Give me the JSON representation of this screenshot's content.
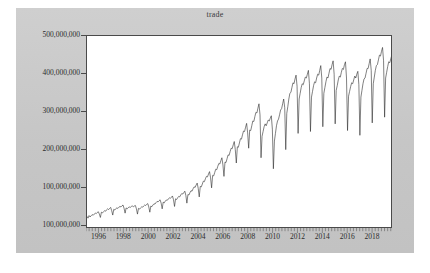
{
  "chart_data": {
    "type": "line",
    "title": "trade",
    "xlabel": "",
    "ylabel": "",
    "grid": false,
    "legend": "none",
    "line_color": "#2b2b2b",
    "background_color": "#c9c9c9",
    "plot_background_color": "#ffffff",
    "axis_color": "#4a4a4a",
    "xlim": [
      1995.0,
      2019.6
    ],
    "ylim": [
      100000000,
      500000000
    ],
    "y_ticks": [
      500000000,
      400000000,
      300000000,
      200000000,
      100000000,
      100000000
    ],
    "y_tick_labels": [
      "500,000,000",
      "400,000,000",
      "300,000,000",
      "200,000,000",
      "100,000,000",
      "100,000,000"
    ],
    "x_ticks": [
      1996,
      1998,
      2000,
      2002,
      2004,
      2006,
      2008,
      2010,
      2012,
      2014,
      2016,
      2018
    ],
    "x_tick_labels": [
      "1996",
      "1998",
      "2000",
      "2002",
      "2004",
      "2006",
      "2008",
      "2010",
      "2012",
      "2014",
      "2016",
      "2018"
    ],
    "x_minor_tick_interval_years": 0.25,
    "series": [
      {
        "name": "trade",
        "frequency": "monthly",
        "x_start": 1995.0,
        "x_step": 0.08333,
        "values": [
          122000000,
          118500000,
          124000000,
          121000000,
          123500000,
          126000000,
          124500000,
          127000000,
          129000000,
          128000000,
          130500000,
          132000000,
          127000000,
          120000000,
          131000000,
          129500000,
          132000000,
          134000000,
          133000000,
          136000000,
          138000000,
          136500000,
          139000000,
          141000000,
          134000000,
          125000000,
          137000000,
          135500000,
          138500000,
          140000000,
          139000000,
          141500000,
          143000000,
          142000000,
          144500000,
          146000000,
          139000000,
          129000000,
          140000000,
          138000000,
          140500000,
          142000000,
          141000000,
          143000000,
          144000000,
          142500000,
          144000000,
          145000000,
          138000000,
          127000000,
          139000000,
          137500000,
          140000000,
          142000000,
          141500000,
          144000000,
          146000000,
          145000000,
          147500000,
          149000000,
          142000000,
          131000000,
          144000000,
          142500000,
          146000000,
          148500000,
          148000000,
          151000000,
          153500000,
          152500000,
          155000000,
          157000000,
          150000000,
          138000000,
          152000000,
          150500000,
          154000000,
          156500000,
          156000000,
          159000000,
          161000000,
          160000000,
          162500000,
          165000000,
          157000000,
          143000000,
          159000000,
          157500000,
          161000000,
          164000000,
          163000000,
          167000000,
          170000000,
          169000000,
          172000000,
          175000000,
          166000000,
          150000000,
          168000000,
          167000000,
          172000000,
          176000000,
          175000000,
          180000000,
          184000000,
          183000000,
          188000000,
          192000000,
          181000000,
          163000000,
          185000000,
          184000000,
          190000000,
          196000000,
          195000000,
          201000000,
          206000000,
          205000000,
          211000000,
          216000000,
          203000000,
          182000000,
          208000000,
          207000000,
          214000000,
          221000000,
          220000000,
          227000000,
          233000000,
          232000000,
          239000000,
          245000000,
          230000000,
          206000000,
          236000000,
          235000000,
          243000000,
          251000000,
          250000000,
          258000000,
          265000000,
          264000000,
          272000000,
          279000000,
          262000000,
          234000000,
          268000000,
          267000000,
          276000000,
          285000000,
          284000000,
          293000000,
          301000000,
          300000000,
          309000000,
          317000000,
          297000000,
          265000000,
          303000000,
          302000000,
          312000000,
          322000000,
          321000000,
          331000000,
          340000000,
          339000000,
          349000000,
          358000000,
          335000000,
          245000000,
          290000000,
          300000000,
          310000000,
          316000000,
          312000000,
          318000000,
          324000000,
          322000000,
          328000000,
          333000000,
          305000000,
          222000000,
          280000000,
          296000000,
          312000000,
          322000000,
          326000000,
          335000000,
          345000000,
          348000000,
          358000000,
          368000000,
          350000000,
          262000000,
          338000000,
          352000000,
          368000000,
          380000000,
          382000000,
          392000000,
          402000000,
          400000000,
          410000000,
          418000000,
          395000000,
          296000000,
          368000000,
          380000000,
          392000000,
          400000000,
          398000000,
          406000000,
          414000000,
          412000000,
          420000000,
          428000000,
          400000000,
          300000000,
          372000000,
          384000000,
          396000000,
          404000000,
          402000000,
          412000000,
          420000000,
          418000000,
          428000000,
          438000000,
          412000000,
          310000000,
          380000000,
          392000000,
          404000000,
          414000000,
          412000000,
          422000000,
          432000000,
          430000000,
          440000000,
          448000000,
          420000000,
          316000000,
          386000000,
          396000000,
          408000000,
          416000000,
          414000000,
          424000000,
          432000000,
          430000000,
          440000000,
          446000000,
          412000000,
          302000000,
          374000000,
          384000000,
          394000000,
          402000000,
          400000000,
          408000000,
          416000000,
          412000000,
          420000000,
          426000000,
          398000000,
          292000000,
          372000000,
          386000000,
          400000000,
          410000000,
          412000000,
          422000000,
          432000000,
          432000000,
          442000000,
          452000000,
          428000000,
          318000000,
          400000000,
          414000000,
          428000000,
          438000000,
          440000000,
          450000000,
          460000000,
          458000000,
          468000000,
          476000000,
          448000000,
          330000000,
          412000000,
          424000000,
          436000000,
          446000000,
          444000000,
          452000000,
          460000000,
          458000000,
          466000000,
          472000000,
          440000000,
          470000000
        ]
      }
    ],
    "annotations": [
      "strong monthly seasonality with deep annual troughs",
      "2008-2009 global financial crisis decline",
      "roughly exponential growth 2002-2008, plateau after 2014"
    ]
  }
}
